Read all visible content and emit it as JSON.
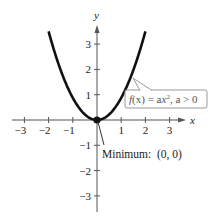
{
  "chart_data": {
    "type": "line",
    "title": "",
    "xlabel": "x",
    "ylabel": "y",
    "xlim": [
      -3.5,
      3.5
    ],
    "ylim": [
      -3.5,
      3.6
    ],
    "grid": false,
    "x_ticks": [
      -3,
      -2,
      -1,
      1,
      2,
      3
    ],
    "y_ticks": [
      -3,
      -2,
      -1,
      1,
      2,
      3
    ],
    "x_tick_labels": [
      "−3",
      "−2",
      "−1",
      "1",
      "2",
      "3"
    ],
    "y_tick_labels": [
      "−3",
      "−2",
      "−1",
      "1",
      "2",
      "3"
    ],
    "series": [
      {
        "name": "f(x) = ax², a > 0",
        "x": [
          -2,
          -1.5,
          -1,
          -0.5,
          0,
          0.5,
          1,
          1.5,
          2
        ],
        "values": [
          3.5,
          1.97,
          0.875,
          0.22,
          0,
          0.22,
          0.875,
          1.97,
          3.5
        ]
      }
    ],
    "annotations": [
      {
        "text": "f(x) = ax², a > 0",
        "boxed": true,
        "points_to": [
          1.5,
          1.97
        ]
      },
      {
        "text": "Minimum:  (0, 0)",
        "points_to": [
          0,
          0
        ]
      }
    ],
    "highlighted_point": {
      "x": 0,
      "y": 0,
      "label": "Minimum"
    }
  },
  "labels": {
    "x_axis": "x",
    "y_axis": "y",
    "callout": {
      "f": "f",
      "paren": "(x) = a",
      "x": "x",
      "exp": "2",
      "rest": ", a > 0"
    },
    "minimum": "Minimum:  (0, 0)"
  }
}
